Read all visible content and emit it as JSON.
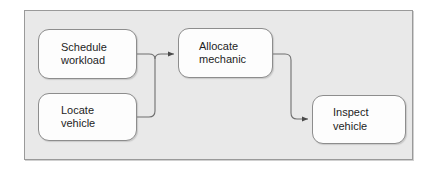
{
  "diagram": {
    "background_color": "#e9e9e9",
    "frame_border_color": "#9a9a9a",
    "node_fill_color": "#fdfdfd",
    "node_border_color": "#8d8d8d",
    "connector_color": "#6f6f6f",
    "nodes": [
      {
        "id": "schedule",
        "line1": "Schedule",
        "line2": "workload"
      },
      {
        "id": "locate",
        "line1": "Locate",
        "line2": "vehicle"
      },
      {
        "id": "allocate",
        "line1": "Allocate",
        "line2": "mechanic"
      },
      {
        "id": "inspect",
        "line1": "Inspect",
        "line2": "vehicle"
      }
    ],
    "connectors": [
      {
        "id": "schedule-to-allocate",
        "from": "schedule",
        "to": "allocate",
        "arrowhead": "filled-triangle"
      },
      {
        "id": "locate-to-allocate",
        "from": "locate",
        "to": "allocate",
        "arrowhead": "filled-triangle"
      },
      {
        "id": "allocate-to-inspect",
        "from": "allocate",
        "to": "inspect",
        "arrowhead": "filled-triangle"
      }
    ]
  }
}
